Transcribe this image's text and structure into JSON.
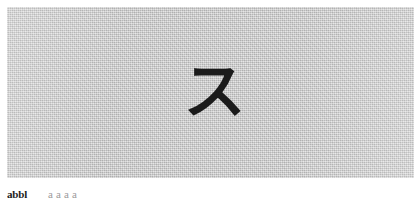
{
  "page": {
    "background_color": "#ffffff",
    "width": 418,
    "height": 200
  },
  "figure": {
    "panel_color": "#c9c9c9",
    "glyph": {
      "character": "ス",
      "romanization": "su",
      "script": "katakana",
      "color": "#1b1b1b"
    }
  },
  "caption": {
    "label": "abbl",
    "text": "a a a a"
  }
}
